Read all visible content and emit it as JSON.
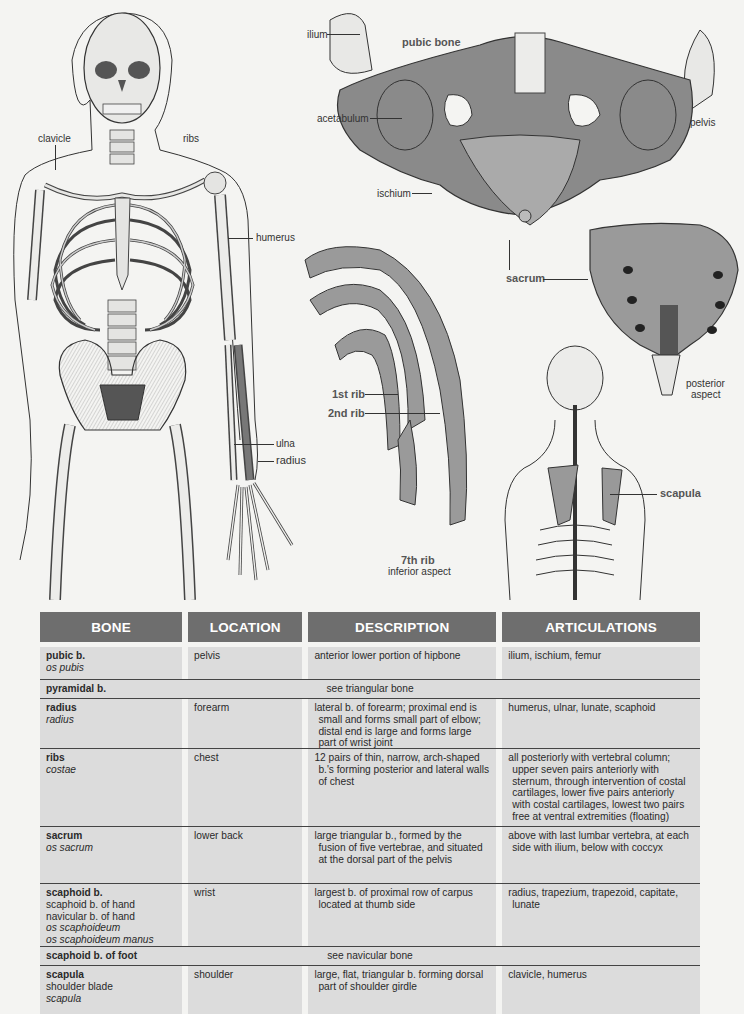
{
  "illustrations": {
    "skeleton_front": {
      "labels": {
        "clavicle": "clavicle",
        "ribs": "ribs",
        "humerus": "humerus",
        "ulna": "ulna",
        "radius": "radius"
      }
    },
    "pelvis": {
      "labels": {
        "ilium": "ilium",
        "pubic_bone": "pubic bone",
        "acetabulum": "acetabulum",
        "pelvis": "pelvis",
        "ischium": "ischium"
      }
    },
    "sacrum": {
      "labels": {
        "sacrum": "sacrum",
        "posterior_aspect_1": "posterior",
        "posterior_aspect_2": "aspect"
      }
    },
    "ribs": {
      "labels": {
        "first_rib": "1st rib",
        "second_rib": "2nd rib",
        "seventh_rib": "7th rib",
        "inferior_aspect": "inferior aspect"
      }
    },
    "back": {
      "labels": {
        "scapula": "scapula"
      }
    }
  },
  "table": {
    "headers": [
      "BONE",
      "LOCATION",
      "DESCRIPTION",
      "ARTICULATIONS"
    ],
    "colors": {
      "header_bg": "#6e6e6e",
      "header_text": "#ffffff",
      "cell_bg": "#dcdcdc",
      "rule": "#444444"
    },
    "rows": [
      {
        "name": "pubic b.",
        "plain": [],
        "latin": [
          "os pubis"
        ],
        "location": "pelvis",
        "description": "anterior lower portion of hipbone",
        "articulations": "ilium, ischium, femur"
      },
      {
        "name": "pyramidal b.",
        "see": "see triangular bone"
      },
      {
        "name": "radius",
        "plain": [],
        "latin": [
          "radius"
        ],
        "location": "forearm",
        "description": "lateral b. of forearm; proximal end is small and forms small part of elbow; distal end is large and forms large part of wrist joint",
        "articulations": "humerus, ulnar, lunate, scaphoid"
      },
      {
        "name": "ribs",
        "plain": [],
        "latin": [
          "costae"
        ],
        "location": "chest",
        "description": "12 pairs of thin, narrow, arch-shaped b.'s forming posterior and lateral walls of chest",
        "articulations": "all posteriorly with vertebral column; upper seven pairs anteriorly with sternum, through intervention of costal cartilages, lower five pairs anteriorly with costal cartilages, lowest two pairs free at ventral extremities (floating)"
      },
      {
        "name": "sacrum",
        "plain": [],
        "latin": [
          "os sacrum"
        ],
        "location": "lower back",
        "description": "large triangular b., formed by the fusion of five vertebrae, and situated at the dorsal part of the pelvis",
        "articulations": "above with last lumbar vertebra, at each side with ilium, below with coccyx"
      },
      {
        "name": "scaphoid b.",
        "plain": [
          "scaphoid b. of hand",
          "navicular b. of hand"
        ],
        "latin": [
          "os scaphoideum",
          "os scaphoideum manus"
        ],
        "location": "wrist",
        "description": "largest b. of proximal row of carpus located at thumb side",
        "articulations": "radius, trapezium, trapezoid, capitate, lunate"
      },
      {
        "name": "scaphoid b. of foot",
        "see": "see navicular bone"
      },
      {
        "name": "scapula",
        "plain": [
          "shoulder blade"
        ],
        "latin": [
          "scapula"
        ],
        "location": "shoulder",
        "description": "large, flat, triangular b. forming dorsal part of shoulder girdle",
        "articulations": "clavicle, humerus"
      }
    ]
  }
}
